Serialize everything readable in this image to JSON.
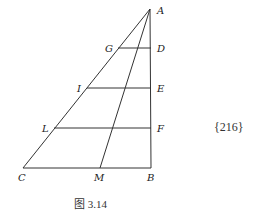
{
  "figure": {
    "caption": "图 3.14",
    "side_note": "{216}",
    "stroke_color": "#333333",
    "points": {
      "A": {
        "label": "A",
        "x": 150,
        "y": 9
      },
      "B": {
        "label": "B",
        "x": 151,
        "y": 168
      },
      "C": {
        "label": "C",
        "x": 23,
        "y": 168
      },
      "M": {
        "label": "M",
        "x": 100,
        "y": 168
      },
      "G": {
        "label": "G",
        "x": 118,
        "y": 48
      },
      "D": {
        "label": "D",
        "x": 151,
        "y": 48
      },
      "I": {
        "label": "I",
        "x": 87,
        "y": 88
      },
      "E": {
        "label": "E",
        "x": 151,
        "y": 88
      },
      "L": {
        "label": "L",
        "x": 54,
        "y": 128
      },
      "F": {
        "label": "F",
        "x": 151,
        "y": 128
      }
    },
    "segments": [
      [
        "A",
        "C"
      ],
      [
        "A",
        "B"
      ],
      [
        "C",
        "B"
      ],
      [
        "A",
        "M"
      ],
      [
        "G",
        "D"
      ],
      [
        "I",
        "E"
      ],
      [
        "L",
        "F"
      ]
    ]
  }
}
